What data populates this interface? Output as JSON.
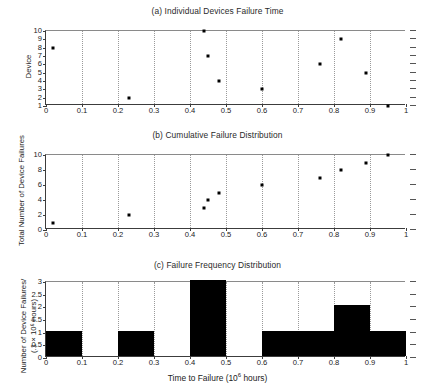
{
  "figure": {
    "panels": [
      {
        "id": "a",
        "title": "(a) Individual Devices Failure Time",
        "ylabel": "Device"
      },
      {
        "id": "b",
        "title": "(b) Cumulative Failure Distribution",
        "ylabel": "Total Number of Device Failures"
      },
      {
        "id": "c",
        "title": "(c) Failure Frequency Distribution",
        "ylabel_line1": "Number of Device Failures/",
        "ylabel_line2": "(.1 × 10⁶ hours)",
        "xlabel_pre": "Time to Failure (10",
        "xlabel_sup": "6",
        "xlabel_post": " hours)"
      }
    ],
    "xticks": [
      "0",
      "0.1",
      "0.2",
      "0.3",
      "0.4",
      "0.5",
      "0.6",
      "0.7",
      "0.8",
      "0.9",
      "1"
    ],
    "yticks_a": [
      "1",
      "2",
      "3",
      "4",
      "5",
      "6",
      "7",
      "8",
      "9",
      "10"
    ],
    "yticks_b": [
      "0",
      "2",
      "4",
      "6",
      "8",
      "10"
    ],
    "yticks_c": [
      "0",
      "0.5",
      "1",
      "1.5",
      "2",
      "2.5",
      "3"
    ],
    "colors": {
      "axis": "#3c3c3c",
      "grid": "#9a9a9a",
      "marker": "#000000",
      "bar": "#000000",
      "background": "#ffffff"
    }
  },
  "chart_data": [
    {
      "type": "scatter",
      "title": "(a) Individual Devices Failure Time",
      "xlabel": "",
      "ylabel": "Device",
      "xlim": [
        0,
        1
      ],
      "ylim": [
        1,
        10
      ],
      "grid": true,
      "x": [
        0.02,
        0.23,
        0.44,
        0.45,
        0.48,
        0.6,
        0.76,
        0.82,
        0.89,
        0.95
      ],
      "y": [
        8,
        2,
        10,
        7,
        4,
        3,
        6,
        9,
        5,
        1
      ],
      "points": [
        {
          "time": 0.02,
          "device": 8
        },
        {
          "time": 0.23,
          "device": 2
        },
        {
          "time": 0.44,
          "device": 10
        },
        {
          "time": 0.45,
          "device": 7
        },
        {
          "time": 0.48,
          "device": 4
        },
        {
          "time": 0.6,
          "device": 3
        },
        {
          "time": 0.76,
          "device": 6
        },
        {
          "time": 0.82,
          "device": 9
        },
        {
          "time": 0.89,
          "device": 5
        },
        {
          "time": 0.95,
          "device": 1
        }
      ]
    },
    {
      "type": "scatter",
      "title": "(b) Cumulative Failure Distribution",
      "xlabel": "",
      "ylabel": "Total Number of Device Failures",
      "xlim": [
        0,
        1
      ],
      "ylim": [
        0,
        10
      ],
      "grid": true,
      "x": [
        0.02,
        0.23,
        0.44,
        0.45,
        0.48,
        0.6,
        0.76,
        0.82,
        0.89,
        0.95
      ],
      "y": [
        1,
        2,
        3,
        4,
        5,
        6,
        7,
        8,
        9,
        10
      ]
    },
    {
      "type": "bar",
      "title": "(c) Failure Frequency Distribution",
      "xlabel": "Time to Failure (10⁶ hours)",
      "ylabel": "Number of Device Failures/ (.1 × 10⁶ hours)",
      "xlim": [
        0,
        1
      ],
      "ylim": [
        0,
        3
      ],
      "grid": true,
      "bin_edges": [
        0,
        0.1,
        0.2,
        0.3,
        0.4,
        0.5,
        0.6,
        0.7,
        0.8,
        0.9,
        1.0
      ],
      "categories": [
        "0-0.1",
        "0.1-0.2",
        "0.2-0.3",
        "0.3-0.4",
        "0.4-0.5",
        "0.5-0.6",
        "0.6-0.7",
        "0.7-0.8",
        "0.8-0.9",
        "0.9-1"
      ],
      "values": [
        1,
        0,
        1,
        0,
        3,
        0,
        1,
        1,
        2,
        1
      ]
    }
  ]
}
